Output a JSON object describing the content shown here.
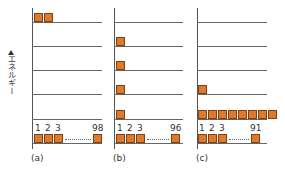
{
  "figure": {
    "y_axis_label": "エネルギー",
    "box_color": "#e07a2a",
    "panels": [
      {
        "label": "(a)",
        "levels": [
          {
            "level": 1,
            "count": 98,
            "labels": [
              "1",
              "2",
              "3",
              "98"
            ]
          },
          {
            "level": 2,
            "count": 0
          },
          {
            "level": 3,
            "count": 0
          },
          {
            "level": 4,
            "count": 0
          },
          {
            "level": 5,
            "count": 0
          },
          {
            "level": 6,
            "count": 2
          }
        ]
      },
      {
        "label": "(b)",
        "levels": [
          {
            "level": 1,
            "count": 96,
            "labels": [
              "1",
              "2",
              "3",
              "96"
            ]
          },
          {
            "level": 2,
            "count": 1
          },
          {
            "level": 3,
            "count": 1
          },
          {
            "level": 4,
            "count": 1
          },
          {
            "level": 5,
            "count": 1
          },
          {
            "level": 6,
            "count": 0
          }
        ]
      },
      {
        "label": "(c)",
        "levels": [
          {
            "level": 1,
            "count": 91,
            "labels": [
              "1",
              "2",
              "3",
              "91"
            ]
          },
          {
            "level": 2,
            "count": 8
          },
          {
            "level": 3,
            "count": 1
          },
          {
            "level": 4,
            "count": 0
          },
          {
            "level": 5,
            "count": 0
          },
          {
            "level": 6,
            "count": 0
          }
        ]
      }
    ]
  },
  "text": {
    "a_label": "(a)",
    "b_label": "(b)",
    "c_label": "(c)",
    "a_n1": "1",
    "a_n2": "2",
    "a_n3": "3",
    "a_nlast": "98",
    "b_n1": "1",
    "b_n2": "2",
    "b_n3": "3",
    "b_nlast": "96",
    "c_n1": "1",
    "c_n2": "2",
    "c_n3": "3",
    "c_nlast": "91",
    "ylabel": "エネルギー"
  }
}
